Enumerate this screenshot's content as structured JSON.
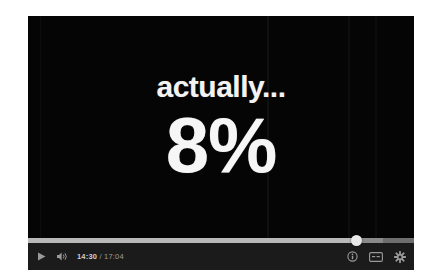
{
  "player": {
    "slide": {
      "headline": "actually...",
      "statistic": "8%"
    },
    "controls": {
      "play_label": "play-icon",
      "volume_label": "volume-icon",
      "current_time": "14:30",
      "time_separator": "/",
      "total_time": "17:04",
      "info_label": "info-icon",
      "captions_label": "closed-captions-icon",
      "settings_label": "settings-gear-icon",
      "progress_percent": 85,
      "buffered_percent": 92
    }
  },
  "colors": {
    "page_background": "#ffffff",
    "video_background": "#050505",
    "control_bar": "#1b1b1b",
    "progress_track": "#6e6e6e",
    "progress_played": "#b9b9b9",
    "scrub_handle": "#e8e8e8",
    "slide_text": "#f2f2f2",
    "icon": "#9a9a9a"
  }
}
